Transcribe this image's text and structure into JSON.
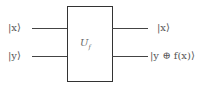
{
  "diagram": {
    "type": "quantum-circuit",
    "gate": {
      "label": "U",
      "subscript": "f"
    },
    "inputs": [
      {
        "label": "|x⟩"
      },
      {
        "label": "|y⟩"
      }
    ],
    "outputs": [
      {
        "label": "|x⟩"
      },
      {
        "label": "|y ⊕ f(x)⟩"
      }
    ]
  }
}
